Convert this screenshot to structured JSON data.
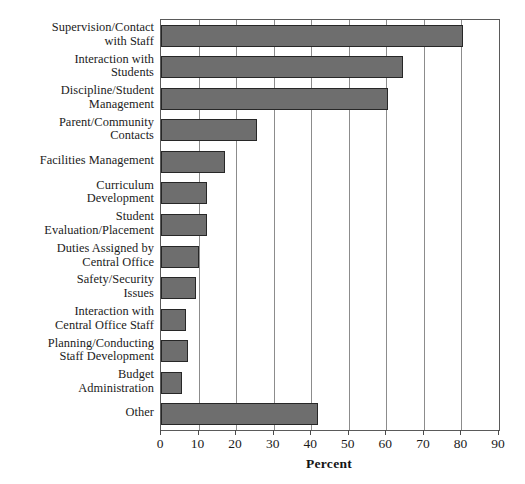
{
  "chart_data": {
    "type": "bar",
    "orientation": "horizontal",
    "title": "",
    "xlabel": "Percent",
    "ylabel": "",
    "xlim": [
      0,
      90
    ],
    "xticks": [
      0,
      10,
      20,
      30,
      40,
      50,
      60,
      70,
      80,
      90
    ],
    "grid": true,
    "grid_axis": "x",
    "legend": false,
    "bar_color": "#6e6e6e",
    "bar_edge_color": "#272727",
    "categories": [
      "Supervision/Contact with Staff",
      "Interaction with Students",
      "Discipline/Student Management",
      "Parent/Community Contacts",
      "Facilities Management",
      "Curriculum Development",
      "Student Evaluation/Placement",
      "Duties Assigned by Central Office",
      "Safety/Security Issues",
      "Interaction with Central Office Staff",
      "Planning/Conducting Staff Development",
      "Budget Administration",
      "Other"
    ],
    "category_lines": [
      [
        "Supervision/Contact",
        "with Staff"
      ],
      [
        "Interaction with",
        "Students"
      ],
      [
        "Discipline/Student",
        "Management"
      ],
      [
        "Parent/Community",
        "Contacts"
      ],
      [
        "Facilities Management"
      ],
      [
        "Curriculum",
        "Development"
      ],
      [
        "Student",
        "Evaluation/Placement"
      ],
      [
        "Duties Assigned by",
        "Central Office"
      ],
      [
        "Safety/Security",
        "Issues"
      ],
      [
        "Interaction with",
        "Central Office Staff"
      ],
      [
        "Planning/Conducting",
        "Staff Development"
      ],
      [
        "Budget",
        "Administration"
      ],
      [
        "Other"
      ]
    ],
    "values": [
      80.5,
      64.5,
      60.5,
      25.5,
      17,
      12.2,
      12.2,
      10.1,
      9.3,
      6.6,
      7.2,
      5.6,
      41.8
    ]
  },
  "axis": {
    "tick_labels": [
      "0",
      "10",
      "20",
      "30",
      "40",
      "50",
      "60",
      "70",
      "80",
      "90"
    ],
    "title": "Percent"
  },
  "caption": {
    "remnant": ""
  }
}
